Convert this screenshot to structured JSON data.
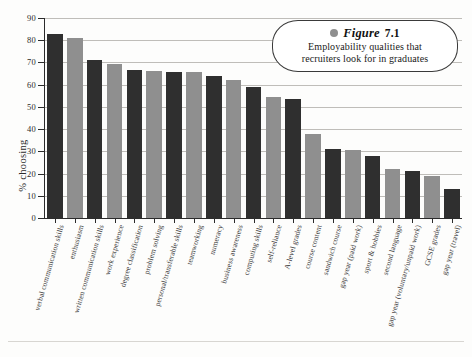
{
  "caption": {
    "bullet_icon": "circle-bullet-icon",
    "figure_label": "Figure",
    "figure_number": "7.1",
    "line1": "Employability qualities that",
    "line2": "recruiters look for in graduates"
  },
  "colors": {
    "bar_dark": "#2f2f2f",
    "bar_light": "#8f8f8f",
    "axis": "#2b2b2b",
    "gridline": "#bfbdb9",
    "background": "#fdfdfc",
    "caption_bullet": "#8f8f8f"
  },
  "chart_data": {
    "type": "bar",
    "title": "Employability qualities that recruiters look for in graduates",
    "xlabel": "",
    "ylabel": "% choosing",
    "ylim": [
      0,
      90
    ],
    "yticks": [
      0,
      10,
      20,
      30,
      40,
      50,
      60,
      70,
      80,
      90
    ],
    "ytick_labels": [
      "0",
      "10",
      "20",
      "30",
      "40",
      "50",
      "60",
      "70",
      "80",
      "90"
    ],
    "grid": true,
    "legend": "none",
    "categories": [
      "verbal communication skills",
      "enthusiasm",
      "written communication skills",
      "work experience",
      "degree classification",
      "problem solving",
      "personal/transferable skills",
      "teamworking",
      "numeracy",
      "business awareness",
      "computing skills",
      "self-reliance",
      "A-level grades",
      "course content",
      "sandwich course",
      "gap year (paid work)",
      "sport & hobbies",
      "second language",
      "gap year (voluntary/unpaid work)",
      "GCSE grades",
      "gap year (travel)"
    ],
    "values": [
      83,
      81,
      71,
      69.5,
      66.5,
      66,
      65.5,
      65.5,
      64,
      62,
      59,
      54.5,
      53.5,
      38,
      31,
      30.5,
      28,
      22,
      21,
      19,
      13
    ],
    "bar_colors": [
      "dark",
      "light",
      "dark",
      "light",
      "dark",
      "light",
      "dark",
      "light",
      "dark",
      "light",
      "dark",
      "light",
      "dark",
      "light",
      "dark",
      "light",
      "dark",
      "light",
      "dark",
      "light",
      "dark"
    ]
  }
}
